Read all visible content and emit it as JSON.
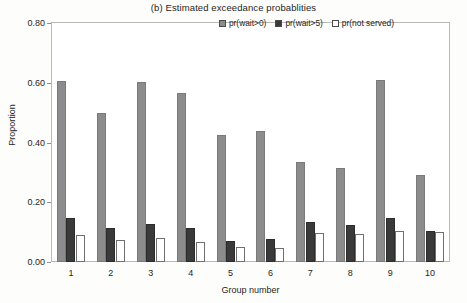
{
  "chart_data": {
    "type": "bar",
    "title": "(b) Estimated exceedance probablities",
    "xlabel": "Group number",
    "ylabel": "Proportion",
    "categories": [
      "1",
      "2",
      "3",
      "4",
      "5",
      "6",
      "7",
      "8",
      "9",
      "10"
    ],
    "ylim": [
      0.0,
      0.8
    ],
    "ytick_labels": [
      "0.00",
      "0.20",
      "0.40",
      "0.60",
      "0.80"
    ],
    "ytick_values": [
      0.0,
      0.2,
      0.4,
      0.6,
      0.8
    ],
    "grid": false,
    "legend_position": "top-right",
    "series": [
      {
        "name": "pr(wait>0)",
        "color": "#8c8c8c",
        "values": [
          0.605,
          0.5,
          0.602,
          0.565,
          0.425,
          0.44,
          0.335,
          0.315,
          0.61,
          0.292
        ]
      },
      {
        "name": "pr(wait>5)",
        "color": "#3a3a3a",
        "values": [
          0.147,
          0.113,
          0.127,
          0.115,
          0.072,
          0.077,
          0.133,
          0.125,
          0.147,
          0.105
        ]
      },
      {
        "name": "pr(not served)",
        "color": "#ffffff",
        "values": [
          0.09,
          0.075,
          0.082,
          0.068,
          0.05,
          0.047,
          0.097,
          0.093,
          0.105,
          0.102
        ]
      }
    ]
  }
}
